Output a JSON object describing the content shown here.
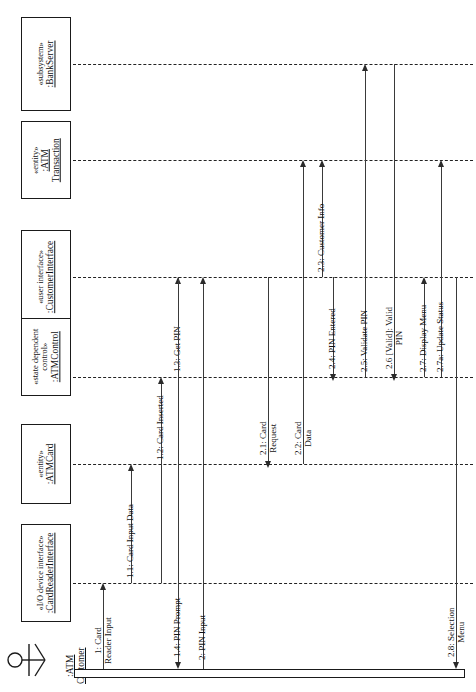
{
  "diagram": {
    "type": "uml-sequence-diagram",
    "orientation": "rotated-90-ccw"
  },
  "actor": {
    "name": ":ATM",
    "name2": "Customer",
    "icon": "stick-figure-actor-icon"
  },
  "lifelines": [
    {
      "id": "cardreader",
      "stereotype": "«I/O device interface»",
      "name": ":CardReaderInterface",
      "name2": ""
    },
    {
      "id": "atmcard",
      "stereotype": "«entity»",
      "name": ":ATMCard",
      "name2": ""
    },
    {
      "id": "atmcontrol",
      "stereotype": "«state dependent",
      "stereotype2": "control»",
      "name": ":ATMControl",
      "name2": ""
    },
    {
      "id": "custiface",
      "stereotype": "«user interface»",
      "name": ":CustomerInterface",
      "name2": ""
    },
    {
      "id": "atmtrans",
      "stereotype": "«entity»",
      "name": ":ATM",
      "name2": "Transaction"
    },
    {
      "id": "bankserver",
      "stereotype": "«subsystem»",
      "name": ":BankServer",
      "name2": ""
    }
  ],
  "messages": [
    {
      "id": "m1",
      "label": "1: Card",
      "label2": "Reader Input",
      "from": "actor",
      "to": "cardreader"
    },
    {
      "id": "m1_1",
      "label": "1.1: Card Input Data",
      "label2": "",
      "from": "cardreader",
      "to": "atmcard"
    },
    {
      "id": "m1_2",
      "label": "1.2: Card Inserted",
      "label2": "",
      "from": "atmcard",
      "to": "atmcontrol"
    },
    {
      "id": "m1_3",
      "label": "1.3: Get PIN",
      "label2": "",
      "from": "atmcontrol",
      "to": "custiface"
    },
    {
      "id": "m1_4",
      "label": "1.4: PIN Prompt",
      "label2": "",
      "from": "custiface",
      "to": "actor"
    },
    {
      "id": "m2",
      "label": "2: PIN Input",
      "label2": "",
      "from": "actor",
      "to": "cardreader"
    },
    {
      "id": "m2_1",
      "label": "2.1: Card",
      "label2": "Request",
      "from": "atmcontrol",
      "to": "atmcard"
    },
    {
      "id": "m2_2",
      "label": "2.2: Card",
      "label2": "Data",
      "from": "atmcard",
      "to": "atmtrans"
    },
    {
      "id": "m2_3",
      "label": "2.3: Customer Info",
      "label2": "",
      "from": "custiface",
      "to": "atmtrans"
    },
    {
      "id": "m2_4",
      "label": "2.4: PIN Entered",
      "label2": "",
      "from": "custiface",
      "to": "atmcontrol"
    },
    {
      "id": "m2_5",
      "label": "2.5: Validate PIN",
      "label2": "",
      "from": "atmtrans",
      "to": "bankserver"
    },
    {
      "id": "m2_6",
      "label": "2.6 [Valid]: Valid",
      "label2": "PIN",
      "from": "bankserver",
      "to": "atmcontrol"
    },
    {
      "id": "m2_7",
      "label": "2.7: Display Menu",
      "label2": "",
      "from": "atmcontrol",
      "to": "custiface"
    },
    {
      "id": "m2_7a",
      "label": "2.7a: Update Status",
      "label2": "",
      "from": "atmcontrol",
      "to": "atmtrans"
    },
    {
      "id": "m2_8",
      "label": "2.8: Selection",
      "label2": "Menu",
      "from": "custiface",
      "to": "actor"
    }
  ],
  "colors": {
    "line": "#2a2a2a",
    "box_border": "#1a1a1a",
    "background": "#ffffff"
  }
}
